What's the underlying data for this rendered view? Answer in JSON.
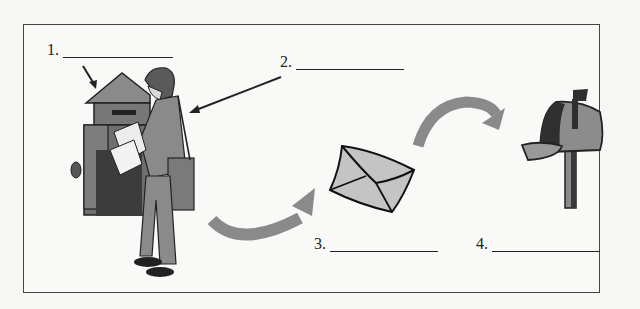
{
  "worksheet": {
    "labels": [
      {
        "number": "1.",
        "blank": "",
        "target": "postbox"
      },
      {
        "number": "2.",
        "blank": "",
        "target": "postman"
      },
      {
        "number": "3.",
        "blank": "",
        "target": "letter"
      },
      {
        "number": "4.",
        "blank": "",
        "target": "mailbox"
      }
    ]
  },
  "colors": {
    "border": "#444444",
    "arrow_gray": "#8a8a8a",
    "envelope": "#c4c4c4",
    "mailbox_dark": "#2f2f2f",
    "mailbox_mid": "#8c8c8c",
    "postbox": "#7a7a7a"
  }
}
